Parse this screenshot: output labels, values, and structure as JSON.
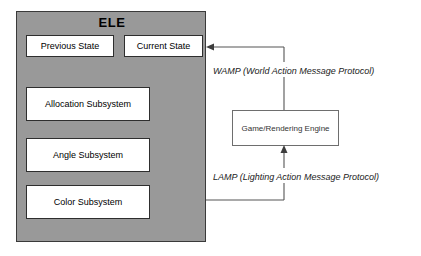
{
  "diagram": {
    "background_color": "#ffffff",
    "ele": {
      "title": "ELE",
      "fill_color": "#999999",
      "border_color": "#3a3a3a",
      "state_boxes": [
        {
          "label": "Previous State"
        },
        {
          "label": "Current State"
        }
      ],
      "subsystems": [
        {
          "label": "Allocation Subsystem"
        },
        {
          "label": "Angle Subsystem"
        },
        {
          "label": "Color Subsystem"
        }
      ]
    },
    "engine": {
      "label": "Game/Rendering Engine",
      "fill_color": "#ffffff",
      "border_color": "#6e6e6e"
    },
    "connections": [
      {
        "name": "wamp",
        "label": "WAMP (World Action Message Protocol)",
        "from": "Game/Rendering Engine",
        "to": "Current State",
        "direction": "right-to-left"
      },
      {
        "name": "lamp",
        "label": "LAMP (Lighting Action Message Protocol)",
        "from": "Color Subsystem",
        "to": "Game/Rendering Engine",
        "direction": "left-to-right-then-up"
      }
    ]
  }
}
